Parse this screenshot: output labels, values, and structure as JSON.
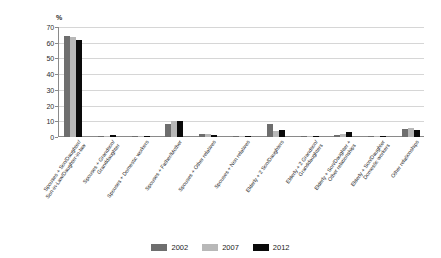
{
  "chart_data": {
    "type": "bar",
    "title": "",
    "subtitle": "",
    "xlabel": "",
    "ylabel": "%",
    "ylim": [
      0,
      70
    ],
    "yticks": [
      0,
      10,
      20,
      30,
      40,
      50,
      60,
      70
    ],
    "grid": true,
    "legend_position": "bottom",
    "categories": [
      "Spouses + Son/Daughter/\nSon-in-Law/Daughter-in-law",
      "Spouses + Grandson/\nGranddaughter",
      "Spouses + Domestic workers",
      "Spouses + Father/Mother",
      "Spouses + Other relatives",
      "Spouses + Non relatives",
      "Elderly + 2 Son/Daughters",
      "Elderly + 2 Grandson/\nGranddaughters",
      "Elderly + Son/Daughter +\nOther relationships",
      "Elderly + Son/Daughter\nDomestic workers",
      "Other relationships"
    ],
    "category_lines": [
      [
        "Spouses + Son/Daughter/",
        "Son-in-Law/Daughter-in-law"
      ],
      [
        "Spouses + Grandson/",
        "Granddaughter"
      ],
      [
        "Spouses + Domestic workers"
      ],
      [
        "Spouses + Father/Mother"
      ],
      [
        "Spouses + Other relatives"
      ],
      [
        "Spouses + Non relatives"
      ],
      [
        "Elderly + 2 Son/Daughters"
      ],
      [
        "Elderly + 2 Grandson/",
        "Granddaughters"
      ],
      [
        "Elderly + Son/Daughter +",
        "Other relationships"
      ],
      [
        "Elderly + Son/Daughter",
        "Domestic workers"
      ],
      [
        "Other relationships"
      ]
    ],
    "series": [
      {
        "name": "2002",
        "color": "#6e6e6e",
        "values": [
          64.5,
          0.8,
          0.3,
          8.0,
          2.2,
          0.2,
          8.2,
          0.3,
          1.0,
          0.1,
          5.0
        ]
      },
      {
        "name": "2007",
        "color": "#b8b8b8",
        "values": [
          63.5,
          0.9,
          0.4,
          10.0,
          2.0,
          0.3,
          4.0,
          0.3,
          2.0,
          0.1,
          6.0
        ]
      },
      {
        "name": "2012",
        "color": "#0a0a0a",
        "values": [
          62.0,
          1.0,
          0.6,
          10.2,
          1.5,
          0.3,
          4.5,
          0.2,
          3.5,
          0.1,
          4.5
        ]
      }
    ]
  },
  "legend": {
    "items": [
      {
        "label": "2002",
        "color": "#6e6e6e"
      },
      {
        "label": "2007",
        "color": "#b8b8b8"
      },
      {
        "label": "2012",
        "color": "#0a0a0a"
      }
    ]
  },
  "axis": {
    "y_unit_label": "%"
  }
}
